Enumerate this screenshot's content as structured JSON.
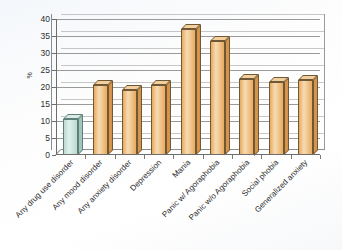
{
  "chart_data": {
    "type": "bar",
    "title": "",
    "xlabel": "",
    "ylabel": "%",
    "ylim": [
      0,
      40
    ],
    "yticks": [
      0,
      5,
      10,
      15,
      20,
      25,
      30,
      35,
      40
    ],
    "grid": true,
    "legend": "none",
    "categories": [
      "Any drug use disorder",
      "Any mood disorder",
      "Any anxiety disorder",
      "Depression",
      "Mania",
      "Panic w/ Agoraphobia",
      "Panic w/o Agoraphobia",
      "Social phobia",
      "Generalized anxiety"
    ],
    "values": [
      10.5,
      20.5,
      19.0,
      20.5,
      37.0,
      33.5,
      22.5,
      21.5,
      22.0
    ],
    "bar_colors": [
      "#bcd9d2",
      "#e9aa5e",
      "#e9aa5e",
      "#e9aa5e",
      "#e9aa5e",
      "#e9aa5e",
      "#e9aa5e",
      "#e9aa5e",
      "#e9aa5e"
    ],
    "bar_top_colors": [
      "#d8ebe6",
      "#f3cf9e",
      "#f3cf9e",
      "#f3cf9e",
      "#f3cf9e",
      "#f3cf9e",
      "#f3cf9e",
      "#f3cf9e",
      "#f3cf9e"
    ],
    "bar_side_colors": [
      "#a2c6bd",
      "#d8934a",
      "#d8934a",
      "#d8934a",
      "#d8934a",
      "#d8934a",
      "#d8934a",
      "#d8934a",
      "#d8934a"
    ],
    "axis_color": "#6d6d6d",
    "grid_color": "#9a9a9a",
    "background": "#fdfdfe"
  }
}
